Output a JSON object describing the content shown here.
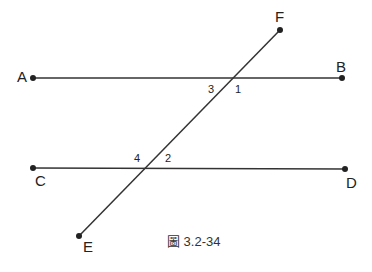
{
  "figure": {
    "caption": "圖 3.2-34",
    "line_color": "#333333",
    "points": {
      "A": {
        "label": "A",
        "x": 33,
        "y": 78
      },
      "B": {
        "label": "B",
        "x": 342,
        "y": 78
      },
      "C": {
        "label": "C",
        "x": 33,
        "y": 168
      },
      "D": {
        "label": "D",
        "x": 345,
        "y": 169
      },
      "E": {
        "label": "E",
        "x": 79,
        "y": 236
      },
      "F": {
        "label": "F",
        "x": 280,
        "y": 30
      }
    },
    "lines": [
      {
        "name": "AB",
        "from": "A",
        "to": "B"
      },
      {
        "name": "CD",
        "from": "C",
        "to": "D"
      },
      {
        "name": "EF",
        "from": "E",
        "to": "F"
      }
    ],
    "angles": {
      "a1": "1",
      "a2": "2",
      "a3": "3",
      "a4": "4"
    }
  }
}
